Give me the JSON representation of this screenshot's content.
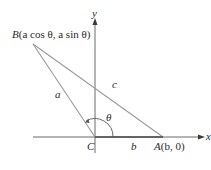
{
  "diagram": {
    "axes": {
      "x_label": "x",
      "y_label": "y"
    },
    "points": {
      "B": {
        "name": "B",
        "coords": "(a cos θ, a sin θ)"
      },
      "A": {
        "name": "A",
        "coords": "(b, 0)"
      },
      "C": {
        "name": "C"
      }
    },
    "sides": {
      "a": "a",
      "b": "b",
      "c": "c"
    },
    "angle": "θ",
    "colors": {
      "line": "#9a9a9a",
      "axis": "#5a5a5a",
      "text": "#2a2a2a",
      "background": "#ffffff"
    }
  }
}
